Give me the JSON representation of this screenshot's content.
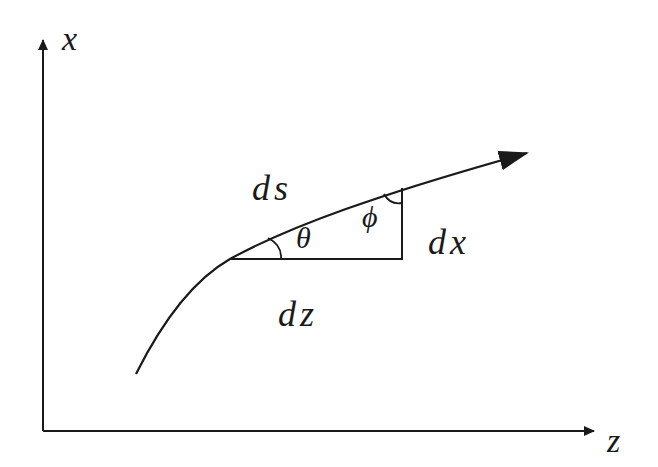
{
  "diagram": {
    "title": "",
    "type": "geometry-schematic",
    "axes": {
      "vertical": {
        "label": "x",
        "direction": "up"
      },
      "horizontal": {
        "label": "z",
        "direction": "right"
      }
    },
    "curve": {
      "description": "ray path curving upward and to the right, ending in an arrowhead",
      "has_arrowhead": true
    },
    "triangle": {
      "hypotenuse_label": "ds",
      "vertical_leg_label": "dx",
      "horizontal_leg_label": "dz",
      "angle_at_base_label": "θ",
      "angle_at_top_label": "ϕ"
    },
    "colors": {
      "stroke": "#1a1a1a",
      "background": "#ffffff"
    }
  }
}
